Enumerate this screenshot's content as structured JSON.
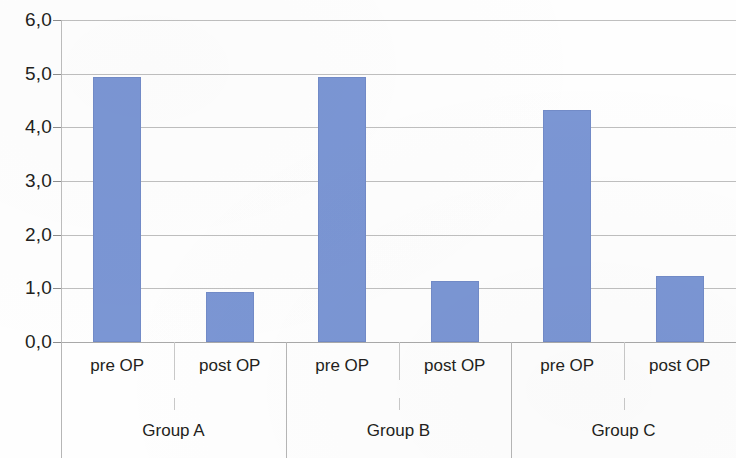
{
  "chart_data": {
    "type": "bar",
    "title": "",
    "xlabel": "",
    "ylabel": "",
    "ylim": [
      0,
      6
    ],
    "ytick_step": 1,
    "grid": true,
    "legend": false,
    "decimal_separator": ",",
    "y_tick_labels": [
      "6,0",
      "5,0",
      "4,0",
      "3,0",
      "2,0",
      "1,0",
      "0,0"
    ],
    "y_tick_values": [
      6,
      5,
      4,
      3,
      2,
      1,
      0
    ],
    "categories": [
      "pre OP",
      "post OP",
      "pre OP",
      "post OP",
      "pre OP",
      "post OP"
    ],
    "groups": [
      "Group A",
      "Group B",
      "Group C"
    ],
    "values": [
      4.94,
      0.94,
      4.94,
      1.13,
      4.33,
      1.23
    ],
    "series": [
      {
        "name": "value",
        "values": [
          4.94,
          0.94,
          4.94,
          1.13,
          4.33,
          1.23
        ]
      }
    ],
    "bars": [
      {
        "group": "Group A",
        "condition": "pre OP",
        "value": 4.94
      },
      {
        "group": "Group A",
        "condition": "post OP",
        "value": 0.94
      },
      {
        "group": "Group B",
        "condition": "pre OP",
        "value": 4.94
      },
      {
        "group": "Group B",
        "condition": "post OP",
        "value": 1.13
      },
      {
        "group": "Group C",
        "condition": "pre OP",
        "value": 4.33
      },
      {
        "group": "Group C",
        "condition": "post OP",
        "value": 1.23
      }
    ],
    "colors": {
      "bar_fill": "#7b96d4",
      "bar_stroke": "#6b83be",
      "gridline": "#b4b4b4",
      "axis": "#bdbdbd",
      "text": "#231f20",
      "background": "#fefefe"
    }
  }
}
